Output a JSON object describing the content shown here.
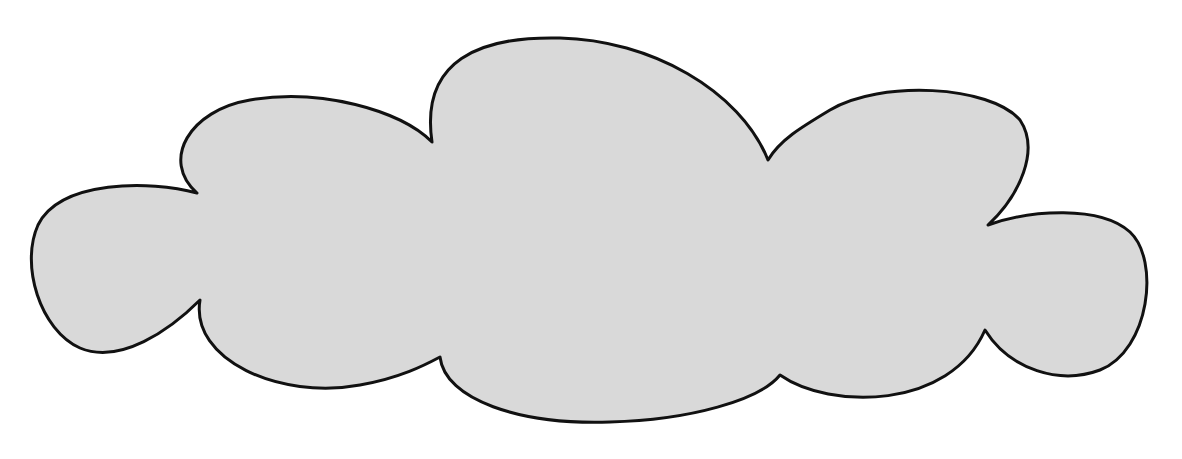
{
  "shape": {
    "name": "cloud",
    "fill": "#d9d9d9",
    "stroke": "#111111",
    "stroke_width": 3
  }
}
